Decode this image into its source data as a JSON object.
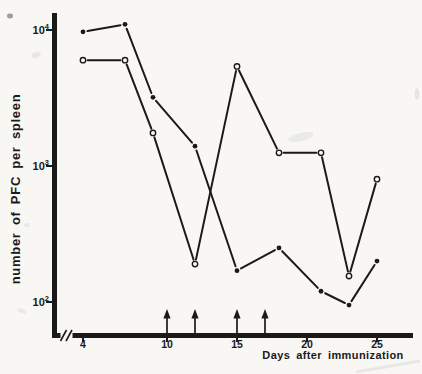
{
  "figure": {
    "background_color": "#f8f7f3",
    "ink_color": "#1a1a1a",
    "kind": "scanned-journal-line-chart"
  },
  "chart_data": {
    "type": "line",
    "title": "",
    "xlabel": "Days after immunization",
    "ylabel": "number of PFC per spleen",
    "x_axis": {
      "label": "Days after immunization",
      "ticks": [
        4,
        10,
        15,
        20,
        25
      ],
      "range": [
        2,
        27.5
      ],
      "axis_break_at_origin": true
    },
    "y_axis": {
      "label": "number of PFC per spleen",
      "scale": "log10",
      "ticks": [
        {
          "base": "10",
          "exp": "4",
          "value": 10000
        },
        {
          "base": "10",
          "exp": "3",
          "value": 1000
        },
        {
          "base": "10",
          "exp": "2",
          "value": 100
        }
      ],
      "range": [
        55,
        13000
      ],
      "grid": false
    },
    "days": [
      4,
      7,
      9,
      12,
      15,
      18,
      21,
      23,
      25
    ],
    "series": [
      {
        "name": "filled-circle-series",
        "marker": "filled-circle",
        "values": [
          9700,
          11000,
          3200,
          1400,
          170,
          250,
          120,
          95,
          200
        ]
      },
      {
        "name": "open-circle-series",
        "marker": "open-circle",
        "values": [
          6000,
          6000,
          1750,
          190,
          5400,
          1250,
          1250,
          155,
          800
        ]
      }
    ],
    "event_arrow_days": [
      10,
      12,
      15,
      17
    ]
  }
}
